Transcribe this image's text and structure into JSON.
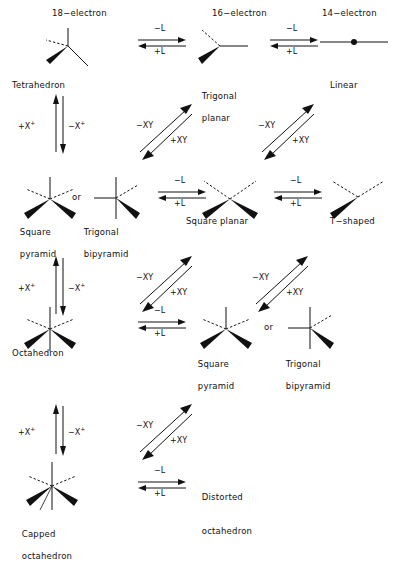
{
  "diagram": {
    "column_headers": [
      {
        "label": "18−electron",
        "x": 52,
        "y": 8
      },
      {
        "label": "16−electron",
        "x": 212,
        "y": 8
      },
      {
        "label": "14−electron",
        "x": 322,
        "y": 8
      }
    ],
    "structures": [
      {
        "name": "tetrahedron",
        "label": "Tetrahedron",
        "label_lines": [
          "Tetrahedron"
        ],
        "shape": "tetrahedron",
        "x": 40,
        "y": 24,
        "label_x": 12,
        "label_y": 80
      },
      {
        "name": "trigonal-planar",
        "label": "Trigonal planar",
        "label_lines": [
          "Trigonal",
          "planar"
        ],
        "shape": "trigonal-planar",
        "x": 196,
        "y": 24,
        "label_x": 196,
        "label_y": 80
      },
      {
        "name": "linear",
        "label": "Linear",
        "label_lines": [
          "Linear"
        ],
        "shape": "linear",
        "x": 318,
        "y": 24,
        "label_x": 330,
        "label_y": 80
      },
      {
        "name": "square-pyramid-row2",
        "label": "Square pyramid",
        "label_lines": [
          "Square",
          "pyramid"
        ],
        "shape": "square-pyramid",
        "x": 20,
        "y": 175,
        "label_x": 14,
        "label_y": 216
      },
      {
        "name": "trigonal-bipyramid-row2",
        "label": "Trigonal bipyramid",
        "label_lines": [
          "Trigonal",
          "bipyramid"
        ],
        "shape": "trigonal-bipyramid",
        "x": 92,
        "y": 175,
        "label_x": 78,
        "label_y": 216
      },
      {
        "name": "square-planar",
        "label": "Square planar",
        "label_lines": [
          "Square planar"
        ],
        "shape": "square-planar",
        "x": 200,
        "y": 175,
        "label_x": 186,
        "label_y": 216
      },
      {
        "name": "t-shaped",
        "label": "T−shaped",
        "label_lines": [
          "T−shaped"
        ],
        "shape": "t-shaped",
        "x": 326,
        "y": 175,
        "label_x": 330,
        "label_y": 216
      },
      {
        "name": "octahedron",
        "label": "Octahedron",
        "label_lines": [
          "Octahedron"
        ],
        "shape": "octahedron",
        "x": 20,
        "y": 305,
        "label_x": 12,
        "label_y": 348
      },
      {
        "name": "square-pyramid-row3",
        "label": "Square pyramid",
        "label_lines": [
          "Square",
          "pyramid"
        ],
        "shape": "square-pyramid",
        "x": 196,
        "y": 305,
        "label_x": 192,
        "label_y": 348
      },
      {
        "name": "trigonal-bipyramid-row3",
        "label": "Trigonal bipyramid",
        "label_lines": [
          "Trigonal",
          "bipyramid"
        ],
        "shape": "trigonal-bipyramid",
        "x": 286,
        "y": 305,
        "label_x": 280,
        "label_y": 348
      },
      {
        "name": "capped-octahedron",
        "label": "Capped octahedron",
        "label_lines": [
          "Capped",
          "octahedron"
        ],
        "shape": "capped-octahedron",
        "x": 20,
        "y": 460,
        "label_x": 16,
        "label_y": 518
      }
    ],
    "or_connectors": [
      {
        "name": "or-row2",
        "label": "or",
        "x": 72,
        "y": 192
      },
      {
        "name": "or-row3",
        "label": "or",
        "x": 264,
        "y": 322
      }
    ],
    "horizontal_equilibria": [
      {
        "name": "eq-tetrahedron-trigonalplanar",
        "top_label": "−L",
        "bottom_label": "+L",
        "x": 136,
        "y": 32
      },
      {
        "name": "eq-trigonalplanar-linear",
        "top_label": "−L",
        "bottom_label": "+L",
        "x": 268,
        "y": 32
      },
      {
        "name": "eq-tbp-squareplanar",
        "top_label": "−L",
        "bottom_label": "+L",
        "x": 156,
        "y": 184
      },
      {
        "name": "eq-squareplanar-tshaped",
        "top_label": "−L",
        "bottom_label": "+L",
        "x": 272,
        "y": 184
      },
      {
        "name": "eq-octahedron-squarepyramid",
        "top_label": "−L",
        "bottom_label": "+L",
        "x": 136,
        "y": 314
      },
      {
        "name": "eq-capped-distorted",
        "top_label": "−L",
        "bottom_label": "+L",
        "x": 136,
        "y": 474
      }
    ],
    "vertical_equilibria": [
      {
        "name": "eq-tetrahedron-squarepyramid",
        "left_label": "+X",
        "left_sup": "+",
        "right_label": "−X",
        "right_sup": "+",
        "x": 38,
        "y": 96
      },
      {
        "name": "eq-squarepyramid-octahedron",
        "left_label": "+X",
        "left_sup": "+",
        "right_label": "−X",
        "right_sup": "+",
        "x": 38,
        "y": 258
      },
      {
        "name": "eq-octahedron-capped",
        "left_label": "+X",
        "left_sup": "+",
        "right_label": "−X",
        "right_sup": "+",
        "x": 38,
        "y": 406
      }
    ],
    "diagonal_equilibria": [
      {
        "name": "eq-diag-trigonalplanar-tbp",
        "upper_label": "−XY",
        "lower_label": "+XY",
        "x": 134,
        "y": 104
      },
      {
        "name": "eq-diag-linear-tshaped",
        "upper_label": "−XY",
        "lower_label": "+XY",
        "x": 256,
        "y": 104
      },
      {
        "name": "eq-diag-squareplanar-squarepyramid",
        "upper_label": "−XY",
        "lower_label": "+XY",
        "x": 134,
        "y": 256
      },
      {
        "name": "eq-diag-tshaped-tbp",
        "upper_label": "−XY",
        "lower_label": "+XY",
        "x": 250,
        "y": 256
      },
      {
        "name": "eq-diag-squarepyramid-capped",
        "upper_label": "−XY",
        "lower_label": "+XY",
        "x": 134,
        "y": 404
      }
    ],
    "text_nodes": [
      {
        "name": "distorted-octahedron-label",
        "label_lines": [
          "Distorted",
          "octahedron"
        ],
        "x": 196,
        "y": 478
      }
    ]
  }
}
